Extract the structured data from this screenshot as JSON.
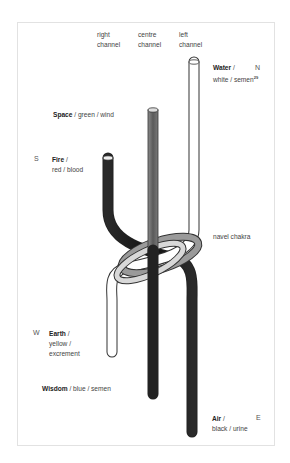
{
  "channels": {
    "right": {
      "line1": "right",
      "line2": "channel"
    },
    "centre": {
      "line1": "centre",
      "line2": "channel"
    },
    "left": {
      "line1": "left",
      "line2": "channel"
    }
  },
  "elements": {
    "water": {
      "name": "Water",
      "sep": " /",
      "desc": "white / semen",
      "note": "29",
      "direction": "N"
    },
    "space": {
      "name": "Space",
      "desc": " / green / wind"
    },
    "fire": {
      "name": "Fire",
      "sep": " /",
      "desc": "red / blood",
      "direction": "S"
    },
    "earth": {
      "name": "Earth",
      "sep": " /",
      "desc1": "yellow /",
      "desc2": "excrement",
      "direction": "W"
    },
    "wisdom": {
      "name": "Wisdom",
      "desc": " / blue / semen"
    },
    "air": {
      "name": "Air",
      "sep": " /",
      "desc": "black / urine",
      "direction": "E"
    }
  },
  "annotations": {
    "navel": "navel chakra"
  },
  "colors": {
    "white_tube": "#ffffff",
    "grey_tube": "#6e6e6e",
    "dark_tube": "#1e1e1e",
    "outline": "#333333"
  }
}
